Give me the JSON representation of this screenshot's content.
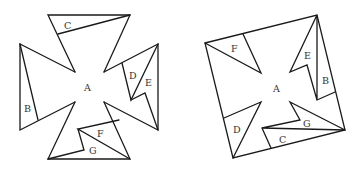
{
  "figures": [
    {
      "name": "cross-shape",
      "labels": {
        "A": "A",
        "B": "B",
        "C": "C",
        "D": "D",
        "E": "E",
        "F": "F",
        "G": "G"
      }
    },
    {
      "name": "tilted-square",
      "labels": {
        "A": "A",
        "B": "B",
        "C": "C",
        "D": "D",
        "E": "E",
        "F": "F",
        "G": "G"
      }
    }
  ],
  "colors": {
    "stroke": "#1a1a1a",
    "label": "#333333",
    "background": "#ffffff"
  }
}
